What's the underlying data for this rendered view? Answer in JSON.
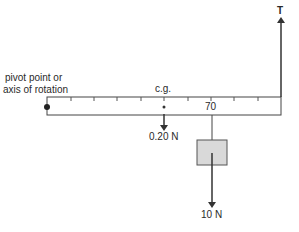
{
  "diagram": {
    "labels": {
      "pivot_line1": "pivot point or",
      "pivot_line2": "axis of rotation",
      "cg": "c.g.",
      "mark_70": "70",
      "weight_ruler": "0.20 N",
      "tension": "T",
      "hanging_weight": "10 N"
    },
    "ruler": {
      "tick_count": 9
    },
    "colors": {
      "line": "#333333",
      "box_fill": "#d9d9d9",
      "box_stroke": "#555555"
    }
  }
}
